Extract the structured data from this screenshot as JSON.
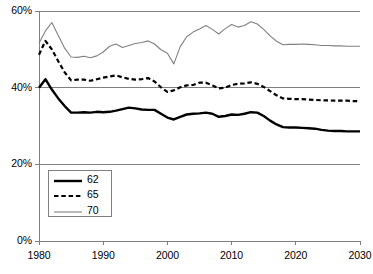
{
  "chart_data": {
    "type": "line",
    "title": "",
    "subtitle": "",
    "xlabel": "",
    "ylabel": "",
    "xlim": [
      1980,
      2030
    ],
    "ylim": [
      0,
      0.6
    ],
    "ytick_labels": [
      "0%",
      "20%",
      "40%",
      "60%"
    ],
    "ytick_values": [
      0,
      20,
      40,
      60
    ],
    "xtick_labels": [
      "1980",
      "1990",
      "2000",
      "2010",
      "2020",
      "2030"
    ],
    "xtick_values": [
      1980,
      1990,
      2000,
      2010,
      2020,
      2030
    ],
    "grid": "horizontal",
    "legend_position": "inside-lower-left",
    "x": [
      1980,
      1981,
      1982,
      1983,
      1984,
      1985,
      1986,
      1987,
      1988,
      1989,
      1990,
      1991,
      1992,
      1993,
      1994,
      1995,
      1996,
      1997,
      1998,
      1999,
      2000,
      2001,
      2002,
      2003,
      2004,
      2005,
      2006,
      2007,
      2008,
      2009,
      2010,
      2011,
      2012,
      2013,
      2014,
      2015,
      2016,
      2017,
      2018,
      2019,
      2020,
      2021,
      2022,
      2023,
      2024,
      2025,
      2026,
      2027,
      2028,
      2029,
      2030
    ],
    "series": [
      {
        "name": "62",
        "style": "solid-thick",
        "color": "#000000",
        "values": [
          40.0,
          42.2,
          39.5,
          37.2,
          35.2,
          33.5,
          33.5,
          33.6,
          33.5,
          33.7,
          33.6,
          33.7,
          34.0,
          34.4,
          34.8,
          34.6,
          34.3,
          34.2,
          34.2,
          33.2,
          32.2,
          31.7,
          32.4,
          33.0,
          33.2,
          33.3,
          33.5,
          33.2,
          32.4,
          32.6,
          33.0,
          32.9,
          33.2,
          33.6,
          33.5,
          32.6,
          31.4,
          30.4,
          29.7,
          29.6,
          29.6,
          29.5,
          29.4,
          29.3,
          29.0,
          28.8,
          28.7,
          28.7,
          28.6,
          28.6,
          28.6
        ]
      },
      {
        "name": "65",
        "style": "dashed",
        "color": "#000000",
        "values": [
          48.6,
          52.2,
          50.0,
          46.9,
          44.0,
          41.9,
          42.1,
          42.1,
          41.8,
          42.2,
          42.6,
          42.9,
          43.2,
          42.7,
          42.3,
          42.1,
          42.2,
          42.5,
          41.6,
          40.1,
          38.9,
          39.3,
          40.1,
          40.6,
          40.7,
          41.3,
          41.3,
          40.6,
          39.8,
          40.0,
          40.7,
          41.0,
          41.1,
          41.4,
          41.0,
          40.2,
          39.1,
          38.0,
          37.2,
          37.1,
          37.0,
          37.0,
          36.9,
          36.8,
          36.7,
          36.7,
          36.6,
          36.6,
          36.6,
          36.5,
          36.5
        ]
      },
      {
        "name": "70",
        "style": "solid-thin",
        "color": "#808080",
        "values": [
          51.6,
          54.8,
          57.0,
          53.6,
          50.3,
          48.0,
          47.9,
          48.2,
          47.8,
          48.3,
          49.3,
          50.8,
          51.4,
          50.5,
          51.0,
          51.5,
          51.8,
          52.2,
          51.4,
          49.9,
          49.0,
          46.2,
          50.7,
          53.3,
          54.5,
          55.3,
          56.2,
          55.2,
          54.0,
          55.4,
          56.5,
          55.8,
          56.2,
          57.2,
          56.6,
          55.2,
          53.5,
          52.1,
          51.2,
          51.3,
          51.3,
          51.4,
          51.3,
          51.2,
          51.0,
          51.0,
          50.9,
          50.9,
          50.8,
          50.8,
          50.8
        ]
      }
    ]
  },
  "legend": {
    "items": [
      {
        "label": "62"
      },
      {
        "label": "65"
      },
      {
        "label": "70"
      }
    ]
  },
  "colors": {
    "axis": "#808080",
    "grid": "#808080",
    "series_62": "#000000",
    "series_65": "#000000",
    "series_70": "#808080",
    "text": "#000000",
    "background": "#ffffff"
  }
}
